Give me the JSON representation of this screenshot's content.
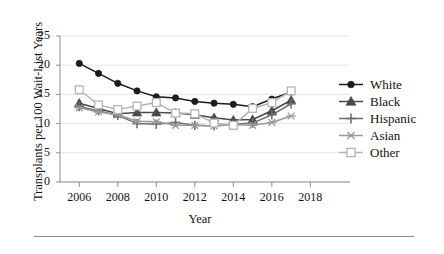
{
  "chart_data": {
    "type": "line",
    "title": "",
    "subtitle": "",
    "xlabel": "Year",
    "ylabel": "Transplants per 100 Wait-List Years",
    "x": [
      2006,
      2007,
      2008,
      2009,
      2010,
      2011,
      2012,
      2013,
      2014,
      2015,
      2016,
      2017
    ],
    "xlim": [
      2005,
      2018.5
    ],
    "ylim": [
      0,
      25
    ],
    "xticks": [
      2006,
      2008,
      2010,
      2012,
      2014,
      2016,
      2018
    ],
    "yticks": [
      0,
      5,
      10,
      15,
      20,
      25
    ],
    "xtick_labels": [
      "2006",
      "2008",
      "2010",
      "2012",
      "2014",
      "2016",
      "2018"
    ],
    "ytick_labels": [
      "0",
      "5",
      "10",
      "15",
      "20",
      "25"
    ],
    "grid": "horizontal",
    "legend_position": "right",
    "series": [
      {
        "name": "White",
        "marker": "filled-circle",
        "color": "#1c1c1c",
        "values": [
          20.3,
          18.6,
          16.9,
          15.6,
          14.6,
          14.4,
          13.8,
          13.5,
          13.3,
          12.9,
          14.2,
          15.4
        ]
      },
      {
        "name": "Black",
        "marker": "filled-triangle",
        "color": "#4a4a4a",
        "values": [
          13.5,
          12.6,
          11.7,
          11.9,
          11.9,
          11.8,
          11.5,
          11.0,
          10.6,
          10.7,
          12.2,
          14.0
        ]
      },
      {
        "name": "Hispanic",
        "marker": "plus",
        "color": "#6e6e6e",
        "values": [
          12.9,
          12.2,
          11.4,
          10.0,
          9.9,
          10.2,
          9.7,
          9.6,
          9.9,
          10.1,
          11.5,
          13.4
        ]
      },
      {
        "name": "Asian",
        "marker": "asterisk",
        "color": "#9a9a9a",
        "values": [
          12.7,
          12.0,
          11.5,
          10.4,
          10.3,
          9.7,
          9.7,
          9.6,
          9.8,
          9.7,
          10.2,
          11.3
        ]
      },
      {
        "name": "Other",
        "marker": "open-square",
        "color": "#b4b4b4",
        "values": [
          15.8,
          13.2,
          12.4,
          13.0,
          13.6,
          11.8,
          11.7,
          10.1,
          9.7,
          12.6,
          13.6,
          15.6
        ]
      }
    ]
  },
  "legend": {
    "entries": [
      {
        "label": "White"
      },
      {
        "label": "Black"
      },
      {
        "label": "Hispanic"
      },
      {
        "label": "Asian"
      },
      {
        "label": "Other"
      }
    ]
  },
  "axes": {
    "ylabel": "Transplants per 100 Wait-List Years",
    "xlabel": "Year"
  }
}
